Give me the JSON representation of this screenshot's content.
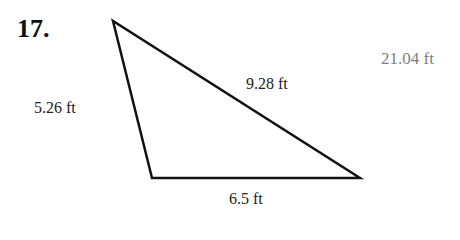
{
  "problem": {
    "number": "17.",
    "answer": "21.04 ft"
  },
  "triangle": {
    "vertices": [
      [
        113,
        21
      ],
      [
        152,
        178
      ],
      [
        360,
        178
      ]
    ],
    "sides": {
      "left": "5.26 ft",
      "hypotenuse": "9.28 ft",
      "bottom": "6.5 ft"
    },
    "stroke_color": "#111111"
  }
}
